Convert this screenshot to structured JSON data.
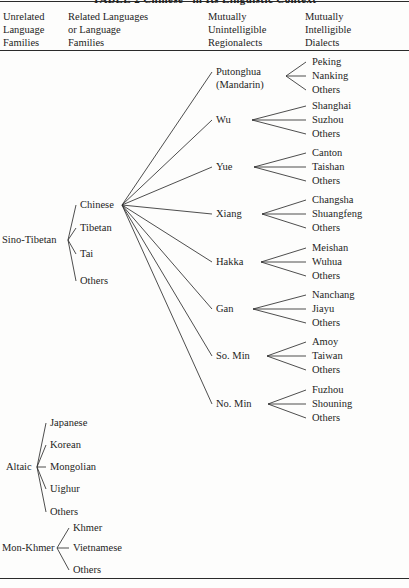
{
  "table": {
    "title": "TABLE 2   Chinese” in Its Linguistic Context",
    "columns": [
      {
        "id": "col-unrelated",
        "lines": [
          "Unrelated",
          "Language",
          "Families"
        ]
      },
      {
        "id": "col-related",
        "lines": [
          "Related Languages",
          "or Language",
          "Families"
        ]
      },
      {
        "id": "col-regionalect",
        "lines": [
          "Mutually",
          "Unintelligible",
          "Regionalects"
        ]
      },
      {
        "id": "col-dialect",
        "lines": [
          "Mutually",
          "Intelligible",
          "Dialects"
        ]
      }
    ]
  },
  "families": [
    {
      "id": "sino-tibetan",
      "label": "Sino-Tibetan",
      "x": 2,
      "y": 240,
      "hub_x": 68,
      "hub_y": 240
    },
    {
      "id": "altaic",
      "label": "Altaic",
      "x": 6,
      "y": 467,
      "hub_x": 37,
      "hub_y": 467
    },
    {
      "id": "mon-khmer",
      "label": "Mon-Khmer",
      "x": 2,
      "y": 548,
      "hub_x": 57,
      "hub_y": 548
    }
  ],
  "branches": [
    {
      "id": "chinese",
      "parent": "sino-tibetan",
      "label": "Chinese",
      "x": 80,
      "y": 205,
      "hub_x": 122,
      "hub_y": 205
    },
    {
      "id": "tibetan",
      "parent": "sino-tibetan",
      "label": "Tibetan",
      "x": 80,
      "y": 228,
      "hub_x": null,
      "hub_y": null
    },
    {
      "id": "tai",
      "parent": "sino-tibetan",
      "label": "Tai",
      "x": 80,
      "y": 254,
      "hub_x": null,
      "hub_y": null
    },
    {
      "id": "st-others",
      "parent": "sino-tibetan",
      "label": "Others",
      "x": 80,
      "y": 281,
      "hub_x": null,
      "hub_y": null
    },
    {
      "id": "japanese",
      "parent": "altaic",
      "label": "Japanese",
      "x": 50,
      "y": 423,
      "hub_x": null,
      "hub_y": null
    },
    {
      "id": "korean",
      "parent": "altaic",
      "label": "Korean",
      "x": 50,
      "y": 445,
      "hub_x": null,
      "hub_y": null
    },
    {
      "id": "mongolian",
      "parent": "altaic",
      "label": "Mongolian",
      "x": 50,
      "y": 467,
      "hub_x": null,
      "hub_y": null
    },
    {
      "id": "uighur",
      "parent": "altaic",
      "label": "Uighur",
      "x": 50,
      "y": 489,
      "hub_x": null,
      "hub_y": null
    },
    {
      "id": "al-others",
      "parent": "altaic",
      "label": "Others",
      "x": 50,
      "y": 512,
      "hub_x": null,
      "hub_y": null
    },
    {
      "id": "khmer",
      "parent": "mon-khmer",
      "label": "Khmer",
      "x": 73,
      "y": 528,
      "hub_x": null,
      "hub_y": null
    },
    {
      "id": "vietnamese",
      "parent": "mon-khmer",
      "label": "Vietnamese",
      "x": 73,
      "y": 548,
      "hub_x": null,
      "hub_y": null
    },
    {
      "id": "mk-others",
      "parent": "mon-khmer",
      "label": "Others",
      "x": 73,
      "y": 570,
      "hub_x": null,
      "hub_y": null
    }
  ],
  "regionalects": [
    {
      "id": "putonghua",
      "label": "Putonghua",
      "label2": "(Mandarin)",
      "x": 216,
      "y": 72,
      "hub_x": 286,
      "hub_y": 76,
      "dialects": [
        {
          "id": "peking",
          "label": "Peking",
          "x": 312,
          "y": 62
        },
        {
          "id": "nanking",
          "label": "Nanking",
          "x": 312,
          "y": 76
        },
        {
          "id": "pth-others",
          "label": "Others",
          "x": 312,
          "y": 90
        }
      ]
    },
    {
      "id": "wu",
      "label": "Wu",
      "label2": null,
      "x": 216,
      "y": 120,
      "hub_x": 252,
      "hub_y": 120,
      "dialects": [
        {
          "id": "shanghai",
          "label": "Shanghai",
          "x": 312,
          "y": 106
        },
        {
          "id": "suzhou",
          "label": "Suzhou",
          "x": 312,
          "y": 120
        },
        {
          "id": "wu-others",
          "label": "Others",
          "x": 312,
          "y": 134
        }
      ]
    },
    {
      "id": "yue",
      "label": "Yue",
      "label2": null,
      "x": 216,
      "y": 167,
      "hub_x": 254,
      "hub_y": 167,
      "dialects": [
        {
          "id": "canton",
          "label": "Canton",
          "x": 312,
          "y": 153
        },
        {
          "id": "taishan",
          "label": "Taishan",
          "x": 312,
          "y": 167
        },
        {
          "id": "yue-others",
          "label": "Others",
          "x": 312,
          "y": 181
        }
      ]
    },
    {
      "id": "xiang",
      "label": "Xiang",
      "label2": null,
      "x": 216,
      "y": 214,
      "hub_x": 262,
      "hub_y": 214,
      "dialects": [
        {
          "id": "changsha",
          "label": "Changsha",
          "x": 312,
          "y": 200
        },
        {
          "id": "shuangfeng",
          "label": "Shuangfeng",
          "x": 312,
          "y": 214
        },
        {
          "id": "xiang-others",
          "label": "Others",
          "x": 312,
          "y": 228
        }
      ]
    },
    {
      "id": "hakka",
      "label": "Hakka",
      "label2": null,
      "x": 216,
      "y": 262,
      "hub_x": 261,
      "hub_y": 262,
      "dialects": [
        {
          "id": "meishan",
          "label": "Meishan",
          "x": 312,
          "y": 248
        },
        {
          "id": "wuhua",
          "label": "Wuhua",
          "x": 312,
          "y": 262
        },
        {
          "id": "hakka-others",
          "label": "Others",
          "x": 312,
          "y": 276
        }
      ]
    },
    {
      "id": "gan",
      "label": "Gan",
      "label2": null,
      "x": 216,
      "y": 309,
      "hub_x": 253,
      "hub_y": 309,
      "dialects": [
        {
          "id": "nanchang",
          "label": "Nanchang",
          "x": 312,
          "y": 295
        },
        {
          "id": "jiayu",
          "label": "Jiayu",
          "x": 312,
          "y": 309
        },
        {
          "id": "gan-others",
          "label": "Others",
          "x": 312,
          "y": 323
        }
      ]
    },
    {
      "id": "so-min",
      "label": "So. Min",
      "label2": null,
      "x": 216,
      "y": 356,
      "hub_x": 267,
      "hub_y": 356,
      "dialects": [
        {
          "id": "amoy",
          "label": "Amoy",
          "x": 312,
          "y": 342
        },
        {
          "id": "taiwan",
          "label": "Taiwan",
          "x": 312,
          "y": 356
        },
        {
          "id": "somin-others",
          "label": "Others",
          "x": 312,
          "y": 370
        }
      ]
    },
    {
      "id": "no-min",
      "label": "No. Min",
      "label2": null,
      "x": 216,
      "y": 404,
      "hub_x": 268,
      "hub_y": 404,
      "dialects": [
        {
          "id": "fuzhou",
          "label": "Fuzhou",
          "x": 312,
          "y": 390
        },
        {
          "id": "shouning",
          "label": "Shouning",
          "x": 312,
          "y": 404
        },
        {
          "id": "nomin-others",
          "label": "Others",
          "x": 312,
          "y": 418
        }
      ]
    }
  ],
  "style": {
    "line_color": "#2e2e2e",
    "text_color": "#1d1d1d",
    "rule_color": "#2a2a2a",
    "background": "#fdfdfc"
  }
}
